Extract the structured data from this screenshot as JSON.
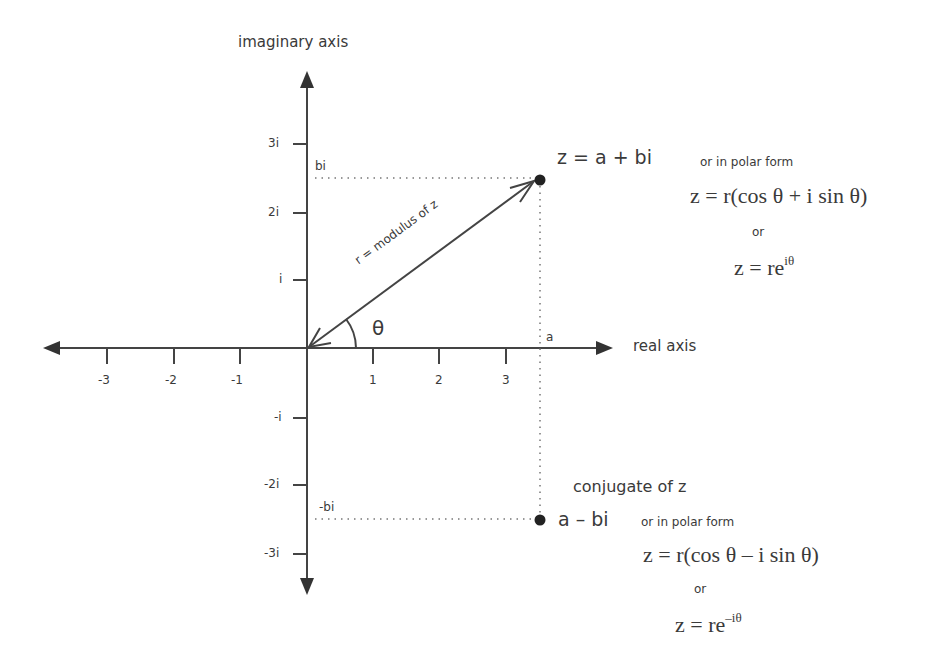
{
  "diagram": {
    "axes": {
      "vertical_label": "imaginary axis",
      "horizontal_label": "real axis",
      "x_ticks": [
        "-3",
        "-2",
        "-1",
        "1",
        "2",
        "3"
      ],
      "y_ticks": [
        "3i",
        "2i",
        "i",
        "-i",
        "-2i",
        "-3i"
      ]
    },
    "guides": {
      "bi_label": "bi",
      "neg_bi_label": "-bi",
      "a_label": "a"
    },
    "vector": {
      "label": "r = modulus of z",
      "angle_label": "θ"
    },
    "point_z": {
      "equation": "z = a + bi",
      "polar_intro": "or in polar form",
      "polar_formula": "z = r(cos θ + i sin θ)",
      "or_label": "or",
      "exp_base": "z = re",
      "exp_power": "iθ"
    },
    "conjugate": {
      "title": "conjugate of z",
      "equation": "a – bi",
      "polar_intro": "or in polar form",
      "polar_formula": "z = r(cos θ – i sin θ)",
      "or_label": "or",
      "exp_base": "z = re",
      "exp_power": "–iθ"
    },
    "colors": {
      "ink": "#3a3a3a",
      "background": "#ffffff"
    }
  }
}
